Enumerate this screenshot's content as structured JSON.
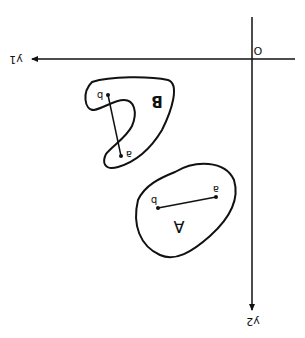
{
  "figure": {
    "orientation": "rotated 180 degrees",
    "axes": {
      "origin_label": "O",
      "horizontal_axis_label": "y1",
      "vertical_axis_label": "y2"
    },
    "regions": [
      {
        "name": "A",
        "label": "A",
        "shape": "convex",
        "points": [
          {
            "label": "a"
          },
          {
            "label": "b"
          }
        ],
        "segment": "a-b lies inside region"
      },
      {
        "name": "B",
        "label": "B",
        "shape": "non-convex",
        "points": [
          {
            "label": "a"
          },
          {
            "label": "b"
          }
        ],
        "segment": "a-b leaves region"
      }
    ],
    "colors": {
      "ink": "#111111",
      "background": "#ffffff"
    }
  }
}
